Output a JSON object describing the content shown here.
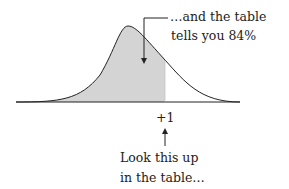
{
  "diagram": {
    "callout_top": {
      "line1": "…and the table",
      "line2": "tells you 84%"
    },
    "tick_label": "+1",
    "callout_bottom": {
      "line1": "Look this up",
      "line2": "in the table…"
    },
    "colors": {
      "shade": "#d4d4d4",
      "stroke": "#222222"
    }
  }
}
